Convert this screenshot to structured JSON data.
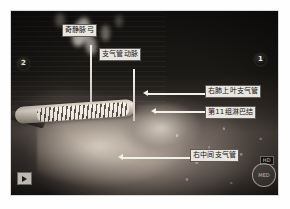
{
  "figure": {
    "type": "endoscopic-surgical-photograph",
    "caption": "",
    "markers": {
      "left": "2",
      "right": "1"
    },
    "controls": {
      "play_icon": "play-icon",
      "badge_text": "HD",
      "watermark_text": "MED"
    },
    "annotations": [
      {
        "id": "azygos-arch",
        "label": "奇静脉弓",
        "leader": "vertical",
        "label_x": 62,
        "label_y": 24,
        "line_x": 79,
        "line_y": 34,
        "line_len": 59
      },
      {
        "id": "bronchial-artery",
        "label": "支气管动脉",
        "leader": "vertical",
        "label_x": 99,
        "label_y": 48,
        "line_x": 122,
        "line_y": 58,
        "line_len": 52
      },
      {
        "id": "right-upper-lobe-bronchus",
        "label": "右肺上叶支气管",
        "leader": "horizontal-left",
        "label_x": 205,
        "label_y": 85,
        "line_x": 137,
        "line_y": 93,
        "line_len": 66
      },
      {
        "id": "station-11-lymph-node",
        "label": "第11组淋巴结",
        "leader": "horizontal-left",
        "label_x": 205,
        "label_y": 106,
        "line_x": 145,
        "line_y": 111,
        "line_len": 58
      },
      {
        "id": "right-intermediate-bronchus",
        "label": "右中间支气管",
        "leader": "horizontal-left",
        "label_x": 190,
        "label_y": 149,
        "line_x": 112,
        "line_y": 157,
        "line_len": 76
      }
    ]
  }
}
